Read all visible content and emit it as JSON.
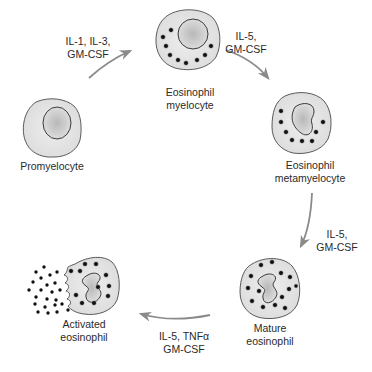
{
  "diagram": {
    "colors": {
      "outline": "#4a4a4a",
      "cytoplasm": "#e4e4e4",
      "nucleus": "#c8c8c8",
      "granule": "#1a1a1a",
      "arrow": "#8a8a8a"
    },
    "cells": [
      {
        "id": "promyelocyte",
        "label_lines": [
          "Promyelocyte"
        ]
      },
      {
        "id": "eosinophil-myelocyte",
        "label_lines": [
          "Eosinophil",
          "myelocyte"
        ]
      },
      {
        "id": "eosinophil-metamyelocyte",
        "label_lines": [
          "Eosinophil",
          "metamyelocyte"
        ]
      },
      {
        "id": "mature-eosinophil",
        "label_lines": [
          "Mature",
          "eosinophil"
        ]
      },
      {
        "id": "activated-eosinophil",
        "label_lines": [
          "Activated",
          "eosinophil"
        ]
      }
    ],
    "transitions": [
      {
        "from": "promyelocyte",
        "to": "eosinophil-myelocyte",
        "label_lines": [
          "IL-1, IL-3,",
          "GM-CSF"
        ]
      },
      {
        "from": "eosinophil-myelocyte",
        "to": "eosinophil-metamyelocyte",
        "label_lines": [
          "IL-5,",
          "GM-CSF"
        ]
      },
      {
        "from": "eosinophil-metamyelocyte",
        "to": "mature-eosinophil",
        "label_lines": [
          "IL-5,",
          "GM-CSF"
        ]
      },
      {
        "from": "mature-eosinophil",
        "to": "activated-eosinophil",
        "label_lines": [
          "IL-5, TNFα",
          "GM-CSF"
        ]
      }
    ]
  }
}
